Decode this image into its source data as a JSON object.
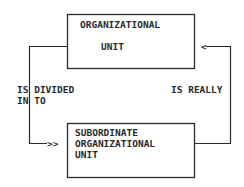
{
  "diagram": {
    "nodes": [
      {
        "id": "organizational-unit",
        "lines": [
          "ORGANIZATIONAL",
          "UNIT"
        ]
      },
      {
        "id": "subordinate-organizational-unit",
        "lines": [
          "SUBORDINATE",
          "ORGANIZATIONAL",
          "UNIT"
        ]
      }
    ],
    "edges": [
      {
        "from": "organizational-unit",
        "to": "subordinate-organizational-unit",
        "label_lines": [
          "IS DIVIDED",
          "IN TO"
        ],
        "arrowhead": ">>"
      },
      {
        "from": "subordinate-organizational-unit",
        "to": "organizational-unit",
        "label_lines": [
          "IS REALLY"
        ],
        "arrowhead": "<"
      }
    ],
    "colors": {
      "line": "#2a2a2a",
      "background": "#ffffff"
    }
  }
}
